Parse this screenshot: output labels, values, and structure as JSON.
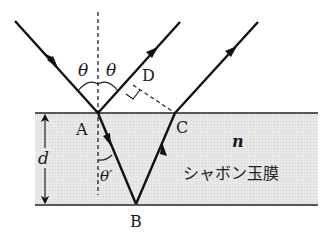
{
  "diagram": {
    "labels": {
      "theta_left": "θ",
      "theta_right": "θ",
      "theta_refr": "θ′",
      "point_A": "A",
      "point_B": "B",
      "point_C": "C",
      "point_D": "D",
      "thickness": "d",
      "index": "n",
      "film_name": "シャボン玉膜"
    },
    "colors": {
      "film_fill": "#e6e6e6",
      "line": "#111111",
      "background": "#ffffff"
    },
    "points": {
      "incident_start": [
        15,
        21
      ],
      "A": [
        98,
        113
      ],
      "B": [
        136,
        204
      ],
      "C": [
        175,
        113
      ],
      "D": [
        133,
        85
      ],
      "reflect1_end": [
        180,
        22
      ],
      "reflect2_end": [
        258,
        22
      ]
    },
    "film": {
      "top_y": 113,
      "bottom_y": 205,
      "left_x": 35,
      "right_x": 318
    }
  }
}
